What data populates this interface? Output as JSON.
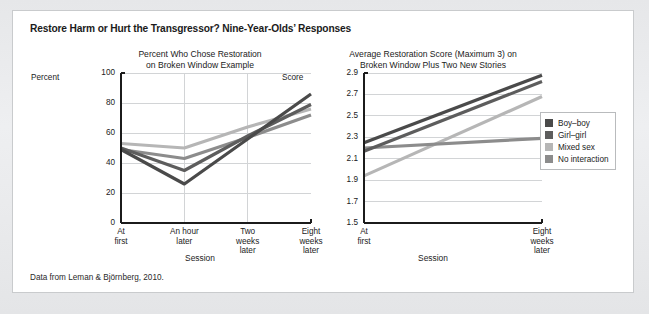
{
  "figure": {
    "title": "Restore Harm or Hurt the Transgressor? Nine-Year-Olds’ Responses",
    "source_note": "Data from Leman & Björnberg, 2010."
  },
  "legend": {
    "position": "right",
    "items": [
      {
        "label": "Boy–boy",
        "color": "#4a4a4a"
      },
      {
        "label": "Girl–girl",
        "color": "#5d5d5d"
      },
      {
        "label": "Mixed sex",
        "color": "#b6b6b6"
      },
      {
        "label": "No interaction",
        "color": "#8c8c8c"
      }
    ]
  },
  "chart_data": [
    {
      "type": "line",
      "id": "left",
      "title": "Percent Who Chose Restoration on Broken Window Example",
      "title_lines": [
        "Percent Who Chose Restoration",
        "on Broken Window Example"
      ],
      "xlabel": "Session",
      "ylabel": "Percent",
      "ylim": [
        0,
        100
      ],
      "yticks": [
        0,
        20,
        40,
        60,
        80,
        100
      ],
      "ytick_labels": [
        "0",
        "20",
        "40",
        "60",
        "80",
        "100"
      ],
      "grid": true,
      "categories": [
        "At first",
        "An hour later",
        "Two weeks later",
        "Eight weeks later"
      ],
      "category_lines": [
        [
          "At",
          "first"
        ],
        [
          "An hour",
          "later"
        ],
        [
          "Two",
          "weeks",
          "later"
        ],
        [
          "Eight",
          "weeks",
          "later"
        ]
      ],
      "series": [
        {
          "name": "Boy–boy",
          "color": "#4a4a4a",
          "values": [
            49,
            26,
            56,
            86
          ]
        },
        {
          "name": "Girl–girl",
          "color": "#5d5d5d",
          "values": [
            50,
            35,
            58,
            79
          ]
        },
        {
          "name": "Mixed sex",
          "color": "#b6b6b6",
          "values": [
            53,
            50,
            64,
            76
          ]
        },
        {
          "name": "No interaction",
          "color": "#8c8c8c",
          "values": [
            49,
            43,
            57,
            72
          ]
        }
      ]
    },
    {
      "type": "line",
      "id": "right",
      "title": "Average Restoration Score (Maximum 3) on Broken Window Plus Two New Stories",
      "title_lines": [
        "Average Restoration Score (Maximum 3) on",
        "Broken Window Plus Two New Stories"
      ],
      "xlabel": "Session",
      "ylabel": "Score",
      "ylim": [
        1.5,
        2.9
      ],
      "yticks": [
        1.5,
        1.7,
        1.9,
        2.1,
        2.3,
        2.5,
        2.7,
        2.9
      ],
      "ytick_labels": [
        "1.5",
        "1.7",
        "1.9",
        "2.1",
        "2.3",
        "2.5",
        "2.7",
        "2.9"
      ],
      "grid": true,
      "categories": [
        "At first",
        "Eight weeks later"
      ],
      "category_lines": [
        [
          "At",
          "first"
        ],
        [
          "Eight",
          "weeks",
          "later"
        ]
      ],
      "series": [
        {
          "name": "Boy–boy",
          "color": "#4a4a4a",
          "values": [
            2.25,
            2.88
          ]
        },
        {
          "name": "Girl–girl",
          "color": "#5d5d5d",
          "values": [
            2.17,
            2.82
          ]
        },
        {
          "name": "Mixed sex",
          "color": "#b6b6b6",
          "values": [
            1.94,
            2.68
          ]
        },
        {
          "name": "No interaction",
          "color": "#8c8c8c",
          "values": [
            2.2,
            2.29
          ]
        }
      ]
    }
  ]
}
